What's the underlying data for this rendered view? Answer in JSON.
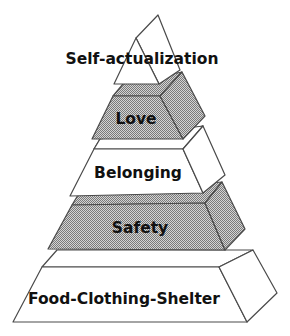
{
  "diagram": {
    "colors": {
      "background": "#ffffff",
      "outline": "#4a4a4a",
      "light_fill": "#ffffff",
      "shaded_fill": "#a8a8a8",
      "text": "#111111"
    },
    "tiers": [
      {
        "label": "Self-actualization",
        "fill": "white"
      },
      {
        "label": "Love",
        "fill": "shaded"
      },
      {
        "label": "Belonging",
        "fill": "white"
      },
      {
        "label": "Safety",
        "fill": "shaded"
      },
      {
        "label": "Food-Clothing-Shelter",
        "fill": "white"
      }
    ]
  }
}
